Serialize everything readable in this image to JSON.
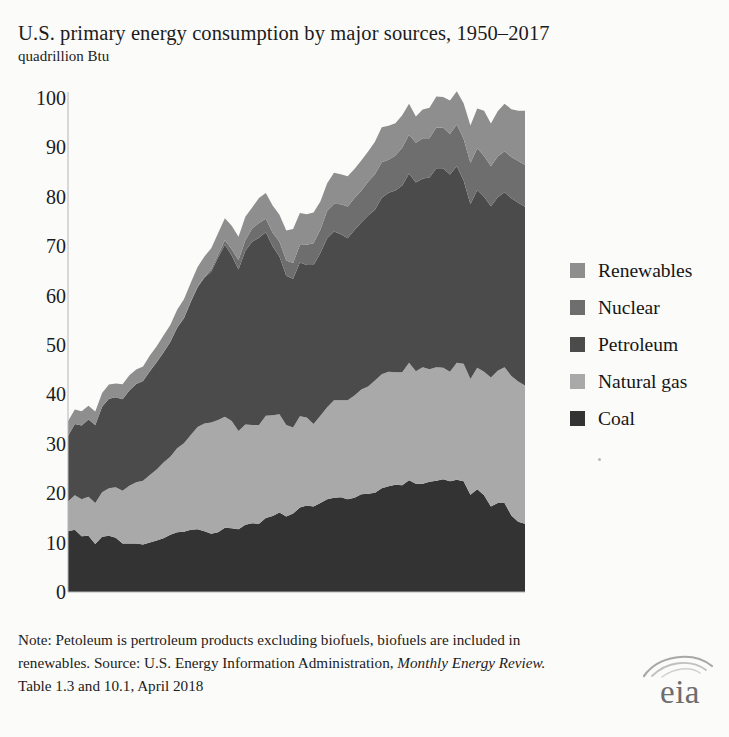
{
  "header": {
    "title": "U.S. primary energy consumption by major sources, 1950–2017",
    "subtitle": "quadrillion Btu"
  },
  "note": {
    "line1": "Note: Petoleum is pertroleum products excluding biofuels, biofuels are included",
    "line2_a": "in renewables. Source: U.S. Energy Information Administration, ",
    "line2_em": "Monthly Energy",
    "line3_em": "Review.",
    "line3_b": " Table 1.3 and 10.1, April 2018"
  },
  "logo": {
    "text": "eia",
    "name": "eia-logo"
  },
  "legend": {
    "position": "right",
    "items": [
      {
        "label": "Renewables",
        "color": "#8e8e8e",
        "icon": "legend-swatch-renewables"
      },
      {
        "label": "Nuclear",
        "color": "#6e6e6e",
        "icon": "legend-swatch-nuclear"
      },
      {
        "label": "Petroleum",
        "color": "#4b4b4b",
        "icon": "legend-swatch-petroleum"
      },
      {
        "label": "Natural gas",
        "color": "#a9a9a9",
        "icon": "legend-swatch-natural-gas"
      },
      {
        "label": "Coal",
        "color": "#333333",
        "icon": "legend-swatch-coal"
      }
    ]
  },
  "axis": {
    "yticks": [
      "0",
      "10",
      "20",
      "30",
      "40",
      "50",
      "60",
      "70",
      "80",
      "90",
      "100"
    ],
    "ylim": [
      0,
      100
    ],
    "xlim": [
      1950,
      2017
    ]
  },
  "colors": {
    "coal": "#333333",
    "natural_gas": "#a9a9a9",
    "petroleum": "#4b4b4b",
    "nuclear": "#6e6e6e",
    "renewables": "#8e8e8e",
    "background": "#fbfbfa",
    "text": "#1b1b1b"
  },
  "chart_data": {
    "type": "area",
    "stacked": true,
    "title": "U.S. primary energy consumption by major sources, 1950–2017",
    "subtitle": "quadrillion Btu",
    "xlabel": "",
    "ylabel": "quadrillion Btu",
    "ylim": [
      0,
      100
    ],
    "grid": false,
    "legend_position": "right",
    "x": [
      1950,
      1951,
      1952,
      1953,
      1954,
      1955,
      1956,
      1957,
      1958,
      1959,
      1960,
      1961,
      1962,
      1963,
      1964,
      1965,
      1966,
      1967,
      1968,
      1969,
      1970,
      1971,
      1972,
      1973,
      1974,
      1975,
      1976,
      1977,
      1978,
      1979,
      1980,
      1981,
      1982,
      1983,
      1984,
      1985,
      1986,
      1987,
      1988,
      1989,
      1990,
      1991,
      1992,
      1993,
      1994,
      1995,
      1996,
      1997,
      1998,
      1999,
      2000,
      2001,
      2002,
      2003,
      2004,
      2005,
      2006,
      2007,
      2008,
      2009,
      2010,
      2011,
      2012,
      2013,
      2014,
      2015,
      2016,
      2017
    ],
    "series": [
      {
        "name": "Coal",
        "color": "#333333",
        "values": [
          12.3,
          12.6,
          11.3,
          11.4,
          9.7,
          11.2,
          11.4,
          11.0,
          9.8,
          9.8,
          9.8,
          9.6,
          10.0,
          10.4,
          10.9,
          11.6,
          12.1,
          12.2,
          12.6,
          12.7,
          12.3,
          11.8,
          12.1,
          13.0,
          12.9,
          12.7,
          13.6,
          13.9,
          13.8,
          15.0,
          15.4,
          16.1,
          15.3,
          15.9,
          17.1,
          17.5,
          17.3,
          18.0,
          18.8,
          19.1,
          19.2,
          18.8,
          19.1,
          19.8,
          19.9,
          20.1,
          21.0,
          21.4,
          21.7,
          21.6,
          22.6,
          21.9,
          21.9,
          22.3,
          22.5,
          22.8,
          22.4,
          22.7,
          22.4,
          19.7,
          20.8,
          19.6,
          17.3,
          18.0,
          18.0,
          15.5,
          14.2,
          13.8
        ]
      },
      {
        "name": "Natural gas",
        "color": "#a9a9a9",
        "values": [
          6.0,
          7.0,
          7.5,
          7.9,
          8.3,
          9.0,
          9.6,
          10.2,
          10.7,
          11.7,
          12.4,
          12.9,
          13.7,
          14.4,
          15.3,
          15.8,
          17.0,
          17.9,
          19.2,
          20.7,
          21.8,
          22.5,
          22.7,
          22.5,
          21.7,
          19.9,
          20.3,
          19.9,
          20.0,
          20.7,
          20.4,
          19.9,
          18.5,
          17.4,
          18.5,
          17.8,
          16.7,
          17.7,
          18.6,
          19.7,
          19.6,
          20.0,
          20.7,
          21.2,
          21.7,
          22.7,
          23.1,
          23.2,
          22.8,
          22.9,
          23.8,
          22.8,
          23.6,
          22.8,
          23.0,
          22.6,
          22.2,
          23.7,
          23.8,
          23.4,
          24.6,
          25.0,
          26.1,
          26.8,
          27.5,
          28.2,
          28.4,
          28.0
        ]
      },
      {
        "name": "Petroleum",
        "color": "#4b4b4b",
        "values": [
          13.3,
          14.4,
          14.9,
          15.6,
          15.8,
          17.3,
          18.1,
          18.2,
          18.5,
          19.3,
          19.9,
          20.2,
          21.0,
          21.7,
          22.3,
          23.2,
          24.4,
          25.3,
          26.9,
          28.3,
          29.5,
          30.6,
          32.9,
          34.8,
          33.5,
          32.7,
          35.2,
          37.1,
          37.9,
          37.1,
          34.2,
          31.9,
          30.2,
          30.1,
          31.1,
          30.9,
          32.2,
          32.9,
          34.2,
          34.2,
          33.6,
          32.8,
          33.5,
          33.8,
          34.6,
          34.6,
          35.7,
          36.2,
          36.8,
          37.8,
          38.3,
          38.2,
          38.2,
          38.8,
          40.3,
          40.4,
          39.9,
          39.8,
          37.1,
          35.4,
          36.0,
          35.4,
          34.7,
          35.1,
          35.4,
          36.0,
          36.2,
          36.2
        ]
      },
      {
        "name": "Nuclear",
        "color": "#6e6e6e",
        "values": [
          0,
          0,
          0,
          0,
          0,
          0,
          0,
          0,
          0,
          0,
          0.01,
          0.02,
          0.03,
          0.04,
          0.04,
          0.04,
          0.06,
          0.09,
          0.14,
          0.15,
          0.24,
          0.41,
          0.58,
          0.91,
          1.27,
          1.9,
          2.11,
          2.7,
          3.02,
          2.78,
          2.74,
          3.01,
          3.13,
          3.2,
          3.55,
          4.08,
          4.38,
          4.75,
          5.59,
          5.6,
          6.1,
          6.42,
          6.48,
          6.41,
          6.84,
          7.18,
          7.17,
          6.68,
          7.07,
          7.61,
          7.86,
          8.03,
          8.14,
          7.96,
          8.22,
          8.16,
          8.21,
          8.46,
          8.43,
          8.35,
          8.43,
          8.27,
          8.06,
          8.24,
          8.34,
          8.34,
          8.43,
          8.42
        ]
      },
      {
        "name": "Renewables",
        "color": "#8e8e8e",
        "values": [
          2.98,
          2.93,
          2.91,
          2.82,
          2.75,
          2.78,
          2.89,
          2.8,
          3.05,
          3.08,
          2.93,
          2.92,
          3.13,
          3.22,
          3.4,
          3.4,
          3.58,
          3.79,
          3.77,
          3.95,
          4.08,
          4.25,
          4.33,
          4.43,
          4.77,
          4.72,
          4.75,
          4.25,
          5.04,
          5.17,
          5.49,
          5.48,
          6.03,
          6.88,
          6.49,
          6.19,
          6.22,
          5.7,
          5.55,
          6.25,
          6.04,
          6.12,
          5.84,
          6.16,
          6.12,
          6.56,
          7.1,
          6.92,
          6.51,
          6.58,
          6.26,
          5.33,
          5.84,
          6.15,
          6.26,
          6.23,
          6.79,
          6.7,
          7.19,
          7.58,
          8.06,
          9.13,
          8.67,
          9.2,
          9.6,
          9.69,
          10.2,
          11.0
        ]
      }
    ]
  }
}
